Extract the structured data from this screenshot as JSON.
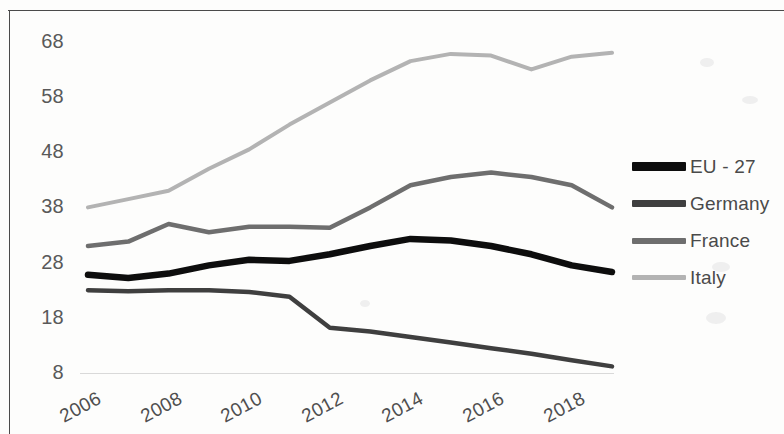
{
  "chart_data": {
    "type": "line",
    "title": "",
    "subtitle": "",
    "xlabel": "",
    "ylabel": "",
    "grid": false,
    "legend_position": "right",
    "x": [
      2006,
      2007,
      2008,
      2009,
      2010,
      2011,
      2012,
      2013,
      2014,
      2015,
      2016,
      2017,
      2018,
      2019
    ],
    "x_tick_labels": [
      "2006",
      "2008",
      "2010",
      "2012",
      "2014",
      "2016",
      "2018"
    ],
    "x_tick_values": [
      2006,
      2008,
      2010,
      2012,
      2014,
      2016,
      2018
    ],
    "y_tick_labels": [
      "8",
      "18",
      "28",
      "38",
      "48",
      "58",
      "68"
    ],
    "y_tick_values": [
      8,
      18,
      28,
      38,
      48,
      58,
      68
    ],
    "ylim": [
      8,
      68
    ],
    "xlim": [
      2006,
      2019
    ],
    "series": [
      {
        "name": "EU - 27",
        "color": "#0d0d0d",
        "width": 6.5,
        "values": [
          25.8,
          25.2,
          26.0,
          27.5,
          28.5,
          28.3,
          29.5,
          31.0,
          32.3,
          32.0,
          31.0,
          29.5,
          27.5,
          26.3
        ]
      },
      {
        "name": "Germany",
        "color": "#3f3f3f",
        "width": 4.5,
        "values": [
          23.0,
          22.8,
          23.0,
          23.0,
          22.7,
          21.8,
          16.2,
          15.5,
          14.5,
          13.5,
          12.5,
          11.5,
          10.3,
          9.2
        ]
      },
      {
        "name": "France",
        "color": "#6e6e6e",
        "width": 4.5,
        "values": [
          31.0,
          31.8,
          35.0,
          33.5,
          34.5,
          34.5,
          34.3,
          38.0,
          42.0,
          43.5,
          44.3,
          43.5,
          42.0,
          38.0
        ]
      },
      {
        "name": "Italy",
        "color": "#b3b3b3",
        "width": 4.0,
        "values": [
          38.0,
          39.5,
          41.0,
          45.0,
          48.5,
          53.0,
          57.0,
          61.0,
          64.5,
          65.8,
          65.5,
          63.0,
          65.3,
          66.0
        ]
      }
    ]
  },
  "legend": {
    "items": [
      {
        "label": "EU - 27",
        "color": "#0d0d0d",
        "thickness": 9
      },
      {
        "label": "Germany",
        "color": "#3f3f3f",
        "thickness": 7
      },
      {
        "label": "France",
        "color": "#6e6e6e",
        "thickness": 6
      },
      {
        "label": "Italy",
        "color": "#b3b3b3",
        "thickness": 5
      }
    ]
  },
  "axis": {
    "baseline_color": "#d9d9d9",
    "tick_label_color": "#595959"
  }
}
